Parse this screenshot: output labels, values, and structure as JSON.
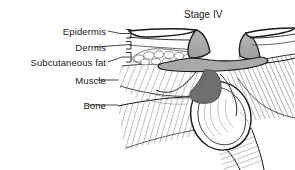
{
  "figure": {
    "title": "Stage IV",
    "kind": "pressure-ulcer-cross-section-illustration"
  },
  "labels": {
    "epidermis": "Epidermis",
    "dermis": "Dermis",
    "subcutaneous_fat": "Subcutaneous fat",
    "muscle": "Muscle",
    "bone": "Bone"
  },
  "colors": {
    "ink": "#1a1a1a",
    "background": "#ffffff",
    "flap_gray": "#a9a9a9",
    "necrotic_gray": "#6f6f6f",
    "hatch_gray": "#8d8d8d",
    "fat_outline": "#5a5a5a"
  }
}
